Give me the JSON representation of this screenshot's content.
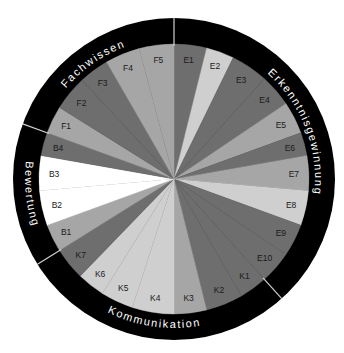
{
  "diagram": {
    "colors": {
      "ring": "#000000",
      "divider": "#d0d0d0",
      "dark": "#6e6e6e",
      "medium": "#a6a6a6",
      "light": "#cfcfcf",
      "white": "#ffffff"
    },
    "categories": [
      {
        "name": "Erkenntnisgewinnung",
        "start_deg": 0,
        "end_deg": 138
      },
      {
        "name": "Kommunikation",
        "start_deg": 138,
        "end_deg": 238
      },
      {
        "name": "Bewertung",
        "start_deg": 238,
        "end_deg": 290
      },
      {
        "name": "Fachwissen",
        "start_deg": 290,
        "end_deg": 360
      }
    ],
    "segments": [
      {
        "label": "E1",
        "start_deg": 0,
        "end_deg": 14,
        "shade": "dark"
      },
      {
        "label": "E2",
        "start_deg": 14,
        "end_deg": 26,
        "shade": "light"
      },
      {
        "label": "E3",
        "start_deg": 26,
        "end_deg": 42,
        "shade": "dark"
      },
      {
        "label": "E4",
        "start_deg": 42,
        "end_deg": 56,
        "shade": "dark"
      },
      {
        "label": "E5",
        "start_deg": 56,
        "end_deg": 70,
        "shade": "medium"
      },
      {
        "label": "E6",
        "start_deg": 70,
        "end_deg": 80,
        "shade": "dark"
      },
      {
        "label": "E7",
        "start_deg": 80,
        "end_deg": 95,
        "shade": "medium"
      },
      {
        "label": "E8",
        "start_deg": 95,
        "end_deg": 110,
        "shade": "light"
      },
      {
        "label": "E9",
        "start_deg": 110,
        "end_deg": 124,
        "shade": "dark"
      },
      {
        "label": "E10",
        "start_deg": 124,
        "end_deg": 138,
        "shade": "dark"
      },
      {
        "label": "K1",
        "start_deg": 138,
        "end_deg": 150,
        "shade": "dark"
      },
      {
        "label": "K2",
        "start_deg": 150,
        "end_deg": 166,
        "shade": "dark"
      },
      {
        "label": "K3",
        "start_deg": 166,
        "end_deg": 180,
        "shade": "medium"
      },
      {
        "label": "K4",
        "start_deg": 180,
        "end_deg": 198,
        "shade": "light"
      },
      {
        "label": "K5",
        "start_deg": 198,
        "end_deg": 212,
        "shade": "light"
      },
      {
        "label": "K6",
        "start_deg": 212,
        "end_deg": 224,
        "shade": "light"
      },
      {
        "label": "K7",
        "start_deg": 224,
        "end_deg": 238,
        "shade": "dark"
      },
      {
        "label": "B1",
        "start_deg": 238,
        "end_deg": 250,
        "shade": "medium"
      },
      {
        "label": "B2",
        "start_deg": 250,
        "end_deg": 265,
        "shade": "white"
      },
      {
        "label": "B3",
        "start_deg": 265,
        "end_deg": 280,
        "shade": "white"
      },
      {
        "label": "B4",
        "start_deg": 280,
        "end_deg": 290,
        "shade": "dark"
      },
      {
        "label": "F1",
        "start_deg": 290,
        "end_deg": 302,
        "shade": "medium"
      },
      {
        "label": "F2",
        "start_deg": 302,
        "end_deg": 317,
        "shade": "dark"
      },
      {
        "label": "F3",
        "start_deg": 317,
        "end_deg": 330,
        "shade": "dark"
      },
      {
        "label": "F4",
        "start_deg": 330,
        "end_deg": 345,
        "shade": "medium"
      },
      {
        "label": "F5",
        "start_deg": 345,
        "end_deg": 360,
        "shade": "medium"
      }
    ]
  }
}
